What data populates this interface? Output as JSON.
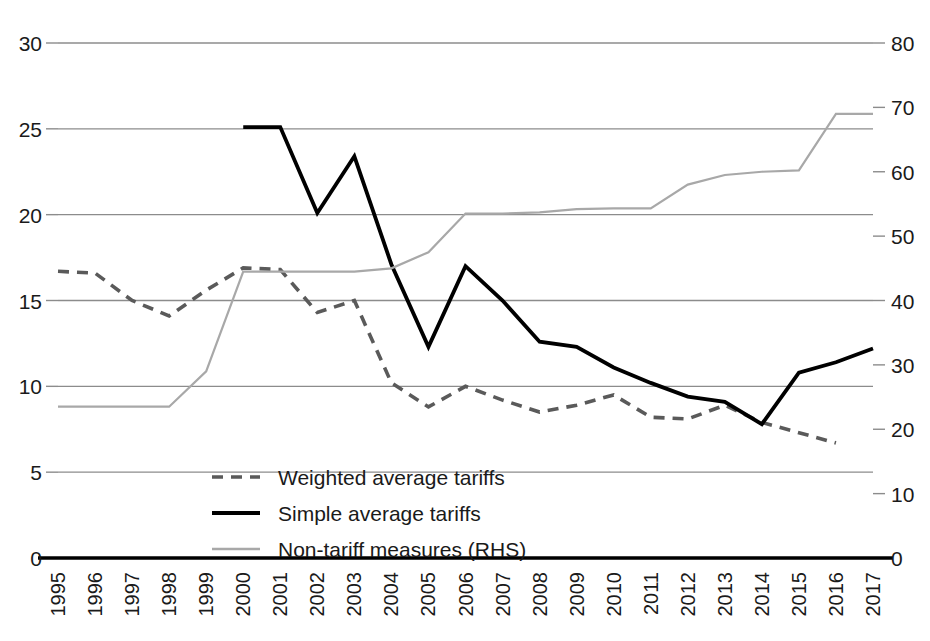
{
  "chart_data": {
    "type": "line",
    "title": "",
    "xlabel": "",
    "ylabel": "",
    "grid": true,
    "legend_position": "inside-bottom-left",
    "x": [
      "1995",
      "1996",
      "1997",
      "1998",
      "1999",
      "2000",
      "2001",
      "2002",
      "2003",
      "2004",
      "2005",
      "2006",
      "2007",
      "2008",
      "2009",
      "2010",
      "2011",
      "2012",
      "2013",
      "2014",
      "2015",
      "2016",
      "2017"
    ],
    "left_axis": {
      "label": "",
      "ticks": [
        0,
        5,
        10,
        15,
        20,
        25,
        30
      ],
      "ylim": [
        0,
        30
      ]
    },
    "right_axis": {
      "label": "",
      "ticks": [
        0,
        10,
        20,
        30,
        40,
        50,
        60,
        70,
        80
      ],
      "ylim": [
        0,
        80
      ]
    },
    "series": [
      {
        "name": "Weighted average tariffs",
        "axis": "left",
        "style": "dashed",
        "color": "#5a5a5a",
        "x": [
          "1995",
          "1996",
          "1997",
          "1998",
          "1999",
          "2000",
          "2001",
          "2002",
          "2003",
          "2004",
          "2005",
          "2006",
          "2007",
          "2008",
          "2009",
          "2010",
          "2011",
          "2012",
          "2013",
          "2014",
          "2015",
          "2016"
        ],
        "values": [
          16.7,
          16.6,
          15.0,
          14.1,
          15.6,
          16.9,
          16.8,
          14.3,
          15.0,
          10.2,
          8.8,
          10.0,
          9.2,
          8.5,
          8.9,
          9.5,
          8.2,
          8.1,
          8.9,
          7.9,
          7.3,
          6.7
        ]
      },
      {
        "name": "Simple average tariffs",
        "axis": "left",
        "style": "solid",
        "color": "#000000",
        "x": [
          "2000",
          "2001",
          "2002",
          "2003",
          "2004",
          "2005",
          "2006",
          "2007",
          "2008",
          "2009",
          "2010",
          "2011",
          "2012",
          "2013",
          "2014",
          "2015",
          "2016",
          "2017"
        ],
        "values": [
          25.1,
          25.1,
          20.1,
          23.4,
          17.1,
          12.3,
          17.0,
          15.0,
          12.6,
          12.3,
          11.1,
          10.2,
          9.4,
          9.1,
          7.8,
          10.8,
          11.4,
          12.2
        ]
      },
      {
        "name": "Non-tariff measures (RHS)",
        "axis": "right",
        "style": "solid-light",
        "color": "#a8a8a8",
        "x": [
          "1995",
          "1996",
          "1997",
          "1998",
          "1999",
          "2000",
          "2001",
          "2002",
          "2003",
          "2004",
          "2005",
          "2006",
          "2007",
          "2008",
          "2009",
          "2010",
          "2011",
          "2012",
          "2013",
          "2014",
          "2015",
          "2016",
          "2017"
        ],
        "values": [
          23.5,
          23.5,
          23.5,
          23.5,
          29.0,
          44.5,
          44.5,
          44.5,
          44.5,
          45.0,
          47.5,
          53.5,
          53.5,
          53.7,
          54.2,
          54.3,
          54.3,
          58.0,
          59.5,
          60.0,
          60.2,
          69.0,
          69.0
        ]
      }
    ],
    "legend": [
      {
        "label": "Weighted average tariffs",
        "style": "dashed",
        "color": "#5a5a5a"
      },
      {
        "label": "Simple average tariffs",
        "style": "solid",
        "color": "#000000"
      },
      {
        "label": "Non-tariff measures (RHS)",
        "style": "solid-light",
        "color": "#a8a8a8"
      }
    ]
  },
  "axis": {
    "left_ticks": [
      "30",
      "25",
      "20",
      "15",
      "10",
      "5",
      "0"
    ],
    "right_ticks": [
      "80",
      "70",
      "60",
      "50",
      "40",
      "30",
      "20",
      "10",
      "0"
    ],
    "x_ticks": [
      "1995",
      "1996",
      "1997",
      "1998",
      "1999",
      "2000",
      "2001",
      "2002",
      "2003",
      "2004",
      "2005",
      "2006",
      "2007",
      "2008",
      "2009",
      "2010",
      "2011",
      "2012",
      "2013",
      "2014",
      "2015",
      "2016",
      "2017"
    ]
  },
  "legend": {
    "item0": "Weighted average tariffs",
    "item1": "Simple average tariffs",
    "item2": "Non-tariff measures (RHS)"
  },
  "colors": {
    "grid": "#8c8c8c",
    "axis": "#000000",
    "weighted": "#5a5a5a",
    "simple": "#000000",
    "ntm": "#a8a8a8",
    "background": "#ffffff"
  }
}
